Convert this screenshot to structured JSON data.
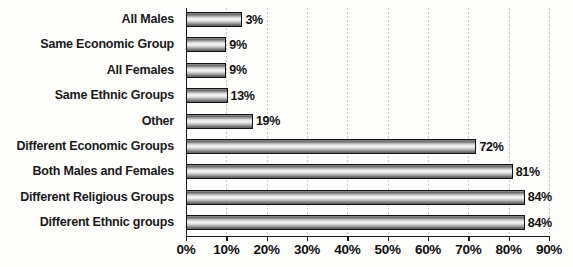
{
  "chart_data": {
    "type": "bar",
    "orientation": "horizontal",
    "title": "",
    "xlabel": "",
    "ylabel": "",
    "xlim": [
      0,
      90
    ],
    "grid": true,
    "legend": null,
    "categories": [
      "All Males",
      "Same Economic Group",
      "All Females",
      "Same Ethnic Groups",
      "Other",
      "Different Economic Groups",
      "Both Males and Females",
      "Different Religious Groups",
      "Different Ethnic groups"
    ],
    "values": [
      3,
      9,
      9,
      13,
      19,
      72,
      81,
      84,
      84
    ],
    "value_labels": [
      "3%",
      "9%",
      "9%",
      "13%",
      "19%",
      "72%",
      "81%",
      "84%",
      "84%"
    ],
    "drawn_widths_pct": [
      14,
      10,
      10,
      10.3,
      16.6,
      72,
      81,
      84,
      84
    ],
    "xticks": [
      0,
      10,
      20,
      30,
      40,
      50,
      60,
      70,
      80,
      90
    ],
    "xtick_labels": [
      "0%",
      "10%",
      "20%",
      "30%",
      "40%",
      "50%",
      "60%",
      "70%",
      "80%",
      "90%"
    ],
    "colors": {
      "bar_outline": "#111111",
      "bar_fill_light": "#f4f4f4",
      "bar_fill_dark": "#5c5c5c",
      "text": "#1a1a1a",
      "gridline": "#c9c9c9",
      "axis": "#1a1a1a",
      "background": "#fdfdfc"
    }
  }
}
